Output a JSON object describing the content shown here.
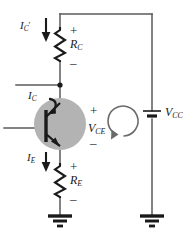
{
  "diagram": {
    "type": "schematic",
    "colors": {
      "wire": "#5a5a5a",
      "ink": "#1a1a1a",
      "transistor_halo": "#b3b3b3",
      "background": "#ffffff"
    },
    "components": {
      "rc": {
        "label_main": "R",
        "label_sub": "C",
        "plus": "+",
        "minus": "–"
      },
      "re": {
        "label_main": "R",
        "label_sub": "E",
        "plus": "+",
        "minus": "–"
      },
      "vcc": {
        "label_main": "V",
        "label_sub": "CC"
      },
      "vce": {
        "label_main": "V",
        "label_sub": "CE",
        "plus": "+",
        "minus": "–"
      },
      "transistor": {
        "name": "npn-transistor",
        "terminals": [
          "collector",
          "base",
          "emitter"
        ]
      },
      "ground_left": {
        "name": "ground-symbol-left"
      },
      "ground_right": {
        "name": "ground-symbol-right"
      }
    },
    "currents": {
      "ic_prime": {
        "label_main": "I",
        "label_sub": "C",
        "prime": "′",
        "direction": "down"
      },
      "ic": {
        "label_main": "I",
        "label_sub": "C",
        "direction": "into-collector"
      },
      "ie": {
        "label_main": "I",
        "label_sub": "E",
        "direction": "down"
      }
    },
    "loop": {
      "name": "kvl-loop-arrow",
      "direction": "clockwise"
    }
  }
}
